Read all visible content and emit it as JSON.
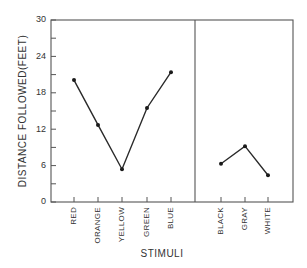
{
  "chart_data": {
    "type": "line",
    "title": "",
    "xlabel": "STIMULI",
    "ylabel": "DISTANCE FOLLOWED(FEET)",
    "ylim": [
      0,
      30
    ],
    "yticks": [
      0,
      6,
      12,
      18,
      24,
      30
    ],
    "yminor_ticks": [
      3,
      9,
      15,
      21,
      27
    ],
    "grid": false,
    "legend": null,
    "panels": [
      {
        "name": "chromatic",
        "categories": [
          "RED",
          "ORANGE",
          "YELLOW",
          "GREEN",
          "BLUE"
        ],
        "values": [
          20.1,
          12.7,
          5.4,
          15.5,
          21.4
        ]
      },
      {
        "name": "achromatic",
        "categories": [
          "BLACK",
          "GRAY",
          "WHITE"
        ],
        "values": [
          6.3,
          9.2,
          4.4
        ]
      }
    ]
  },
  "labels": {
    "ylabel": "DISTANCE FOLLOWED(FEET)",
    "xlabel": "STIMULI",
    "yticks": [
      "0",
      "6",
      "12",
      "18",
      "24",
      "30"
    ],
    "left_categories": [
      "RED",
      "ORANGE",
      "YELLOW",
      "GREEN",
      "BLUE"
    ],
    "right_categories": [
      "BLACK",
      "GRAY",
      "WHITE"
    ]
  }
}
